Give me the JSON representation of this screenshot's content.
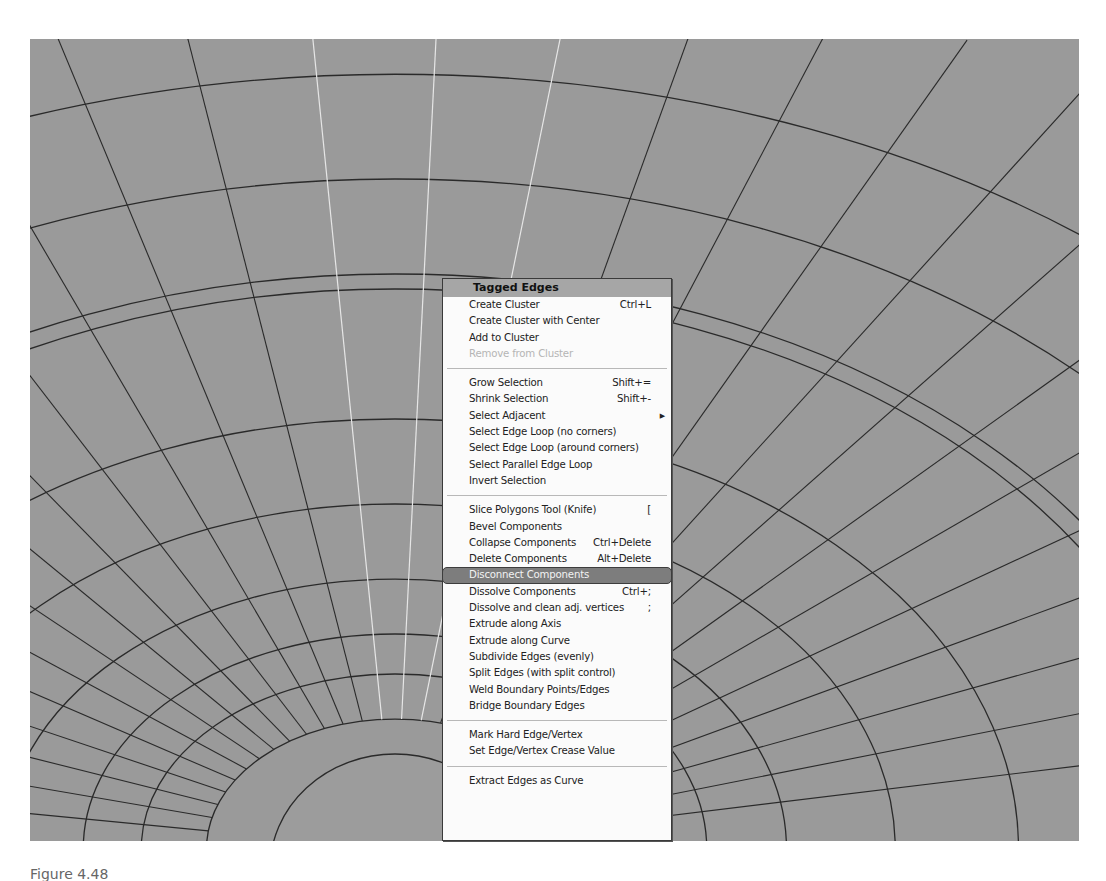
{
  "viewport": {
    "background": "#9a9a9a",
    "mesh_color": "#2a2a2a",
    "selected_edge_color": "#e6e6e6"
  },
  "context_menu": {
    "title": "Tagged Edges",
    "highlight_color": "#7d7d7d",
    "groups": [
      [
        {
          "label": "Create Cluster",
          "shortcut": "Ctrl+L",
          "enabled": true
        },
        {
          "label": "Create Cluster with Center",
          "shortcut": "",
          "enabled": true
        },
        {
          "label": "Add to Cluster",
          "shortcut": "",
          "enabled": true
        },
        {
          "label": "Remove from Cluster",
          "shortcut": "",
          "enabled": false
        }
      ],
      [
        {
          "label": "Grow Selection",
          "shortcut": "Shift+=",
          "enabled": true
        },
        {
          "label": "Shrink Selection",
          "shortcut": "Shift+-",
          "enabled": true
        },
        {
          "label": "Select Adjacent",
          "shortcut": "",
          "enabled": true,
          "submenu": true,
          "submenu_icon": "triangle-right"
        },
        {
          "label": "Select Edge Loop (no corners)",
          "shortcut": "",
          "enabled": true
        },
        {
          "label": "Select Edge Loop (around corners)",
          "shortcut": "",
          "enabled": true
        },
        {
          "label": "Select Parallel Edge Loop",
          "shortcut": "",
          "enabled": true
        },
        {
          "label": "Invert Selection",
          "shortcut": "",
          "enabled": true
        }
      ],
      [
        {
          "label": "Slice Polygons Tool (Knife)",
          "shortcut": "[",
          "enabled": true
        },
        {
          "label": "Bevel Components",
          "shortcut": "",
          "enabled": true
        },
        {
          "label": "Collapse Components",
          "shortcut": "Ctrl+Delete",
          "enabled": true
        },
        {
          "label": "Delete Components",
          "shortcut": "Alt+Delete",
          "enabled": true
        },
        {
          "label": "Disconnect Components",
          "shortcut": "",
          "enabled": true,
          "highlighted": true
        },
        {
          "label": "Dissolve Components",
          "shortcut": "Ctrl+;",
          "enabled": true
        },
        {
          "label": "Dissolve and clean adj. vertices",
          "shortcut": ";",
          "enabled": true
        },
        {
          "label": "Extrude along Axis",
          "shortcut": "",
          "enabled": true
        },
        {
          "label": "Extrude along Curve",
          "shortcut": "",
          "enabled": true
        },
        {
          "label": "Subdivide Edges (evenly)",
          "shortcut": "",
          "enabled": true
        },
        {
          "label": "Split Edges (with split control)",
          "shortcut": "",
          "enabled": true
        },
        {
          "label": "Weld Boundary Points/Edges",
          "shortcut": "",
          "enabled": true
        },
        {
          "label": "Bridge Boundary Edges",
          "shortcut": "",
          "enabled": true
        }
      ],
      [
        {
          "label": "Mark Hard Edge/Vertex",
          "shortcut": "",
          "enabled": true
        },
        {
          "label": "Set Edge/Vertex Crease Value",
          "shortcut": "",
          "enabled": true
        }
      ],
      [
        {
          "label": "Extract Edges as Curve",
          "shortcut": "",
          "enabled": true
        }
      ]
    ]
  },
  "caption": "Figure 4.48"
}
